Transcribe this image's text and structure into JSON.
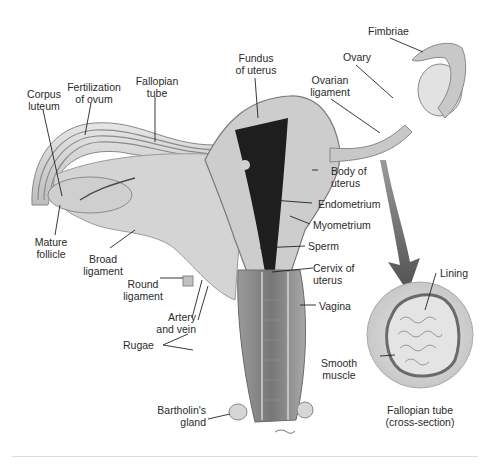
{
  "figure": {
    "labels": {
      "corpus_luteum": "Corpus\nluteum",
      "fertilization": "Fertilization\nof ovum",
      "fallopian_tube": "Fallopian\ntube",
      "fundus": "Fundus\nof uterus",
      "fimbriae": "Fimbriae",
      "ovary": "Ovary",
      "ovarian_ligament": "Ovarian\nligament",
      "body_of_uterus": "Body of\nuterus",
      "endometrium": "Endometrium",
      "myometrium": "Myometrium",
      "sperm": "Sperm",
      "cervix": "Cervix of\nuterus",
      "vagina": "Vagina",
      "mature_follicle": "Mature\nfollicle",
      "broad_ligament": "Broad\nligament",
      "round_ligament": "Round\nligament",
      "artery_vein": "Artery\nand vein",
      "rugae": "Rugae",
      "bartholins_gland": "Bartholin's\ngland",
      "lining": "Lining",
      "smooth_muscle": "Smooth\nmuscle",
      "cross_section_caption": "Fallopian tube\n(cross-section)"
    },
    "colors": {
      "tissue_light": "#d9d9d9",
      "tissue_mid": "#b5b5b5",
      "tissue_dark": "#6e6e6e",
      "cavity": "#1c1c1c",
      "arrow": "#6a6a6a",
      "leader": "#222222"
    }
  }
}
